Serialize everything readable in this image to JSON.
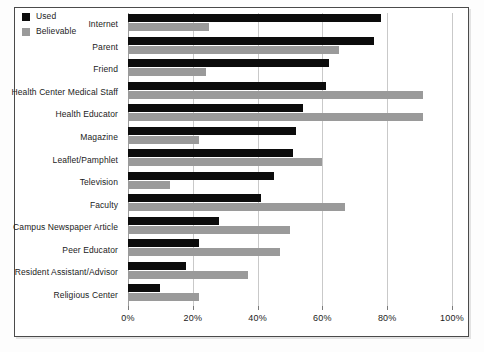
{
  "chart_data": {
    "type": "bar",
    "orientation": "horizontal",
    "title": "",
    "subtitle": "",
    "xlabel": "",
    "ylabel": "",
    "xlim": [
      0,
      100
    ],
    "xticks": [
      0,
      20,
      40,
      60,
      80,
      100
    ],
    "xtick_labels": [
      "0%",
      "20%",
      "40%",
      "60%",
      "80%",
      "100%"
    ],
    "grid": true,
    "grid_axis": "x",
    "legend_position": "top-left",
    "categories": [
      "Internet",
      "Parent",
      "Friend",
      "Health Center Medical Staff",
      "Health Educator",
      "Magazine",
      "Leaflet/Pamphlet",
      "Television",
      "Faculty",
      "Campus Newspaper Article",
      "Peer Educator",
      "Resident Assistant/Advisor",
      "Religious Center"
    ],
    "series": [
      {
        "name": "Used",
        "color": "#0c0c0c",
        "values": [
          78,
          76,
          62,
          61,
          54,
          52,
          51,
          45,
          41,
          28,
          22,
          18,
          10
        ]
      },
      {
        "name": "Believable",
        "color": "#9a9a9a",
        "values": [
          25,
          65,
          24,
          91,
          91,
          22,
          60,
          13,
          67,
          50,
          47,
          37,
          22
        ]
      }
    ]
  },
  "legend": {
    "items": [
      {
        "label": "Used",
        "color": "#0c0c0c"
      },
      {
        "label": "Believable",
        "color": "#9a9a9a"
      }
    ]
  },
  "colors": {
    "used": "#0c0c0c",
    "believable": "#9a9a9a",
    "gridline": "#c9c9c9",
    "frame": "#4a4a4a",
    "text": "#1b1b1b",
    "background": "#ffffff"
  }
}
